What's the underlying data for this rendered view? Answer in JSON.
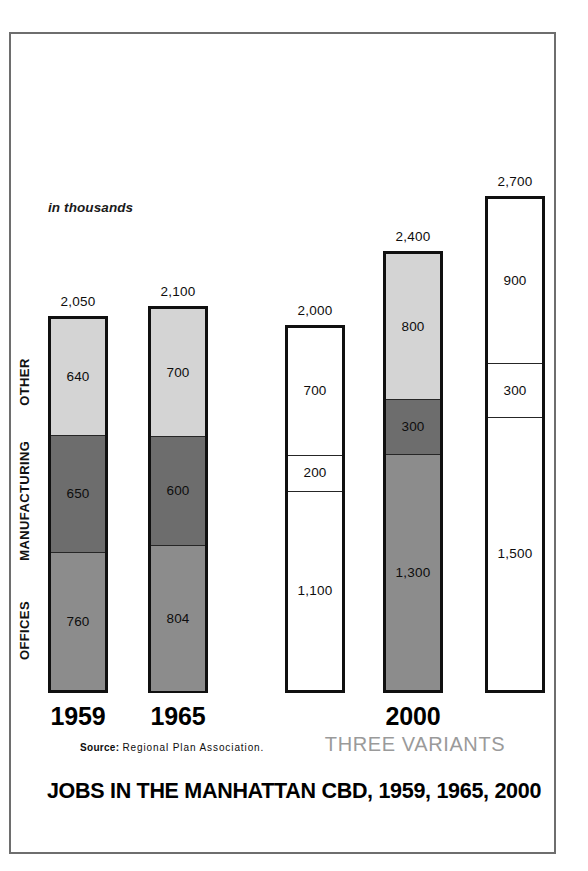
{
  "chart_data": {
    "type": "bar",
    "title": "JOBS IN THE MANHATTAN CBD, 1959, 1965, 2000",
    "subtitle": "in thousands",
    "units_note": "in thousands",
    "source": {
      "lead": "Source:",
      "body": "Regional Plan Association."
    },
    "xlabel": "",
    "ylabel": "",
    "ylim": [
      0,
      2700
    ],
    "grid": false,
    "legend_position": "left-axis-rotated",
    "stacked": true,
    "series": [
      {
        "name": "OFFICES",
        "values": [
          760,
          804,
          1100,
          1300,
          1500
        ]
      },
      {
        "name": "MANUFACTURING",
        "values": [
          650,
          600,
          200,
          300,
          300
        ]
      },
      {
        "name": "OTHER",
        "values": [
          640,
          700,
          700,
          800,
          900
        ]
      }
    ],
    "categories": [
      "1959",
      "1965",
      "2000 variant A",
      "2000 variant B",
      "2000 variant C"
    ],
    "totals": [
      2050,
      2100,
      2000,
      2400,
      2700
    ],
    "annotations": [
      "THREE VARIANTS applies to the last three bars (2000)"
    ]
  },
  "axis_labels": [
    {
      "name": "OTHER",
      "text": "OTHER"
    },
    {
      "name": "MANUFACTURING",
      "text": "MANUFACTURING"
    },
    {
      "name": "OFFICES",
      "text": "OFFICES"
    }
  ],
  "bars": [
    {
      "id": "bar-1959",
      "total_label": "2,050",
      "year_label": "1959",
      "filled": true,
      "segments": [
        {
          "part": "OTHER",
          "label": "640",
          "fill": "light"
        },
        {
          "part": "MANUFACTURING",
          "label": "650",
          "fill": "dark"
        },
        {
          "part": "OFFICES",
          "label": "760",
          "fill": "medium"
        }
      ]
    },
    {
      "id": "bar-1965",
      "total_label": "2,100",
      "year_label": "1965",
      "filled": true,
      "segments": [
        {
          "part": "OTHER",
          "label": "700",
          "fill": "light"
        },
        {
          "part": "MANUFACTURING",
          "label": "600",
          "fill": "dark"
        },
        {
          "part": "OFFICES",
          "label": "804",
          "fill": "medium"
        }
      ]
    },
    {
      "id": "bar-2000-a",
      "total_label": "2,000",
      "year_label": "",
      "filled": false,
      "segments": [
        {
          "part": "OTHER",
          "label": "700",
          "fill": "white"
        },
        {
          "part": "MANUFACTURING",
          "label": "200",
          "fill": "white"
        },
        {
          "part": "OFFICES",
          "label": "1,100",
          "fill": "white"
        }
      ]
    },
    {
      "id": "bar-2000-b",
      "total_label": "2,400",
      "year_label": "2000",
      "filled": true,
      "segments": [
        {
          "part": "OTHER",
          "label": "800",
          "fill": "light"
        },
        {
          "part": "MANUFACTURING",
          "label": "300",
          "fill": "dark"
        },
        {
          "part": "OFFICES",
          "label": "1,300",
          "fill": "medium"
        }
      ]
    },
    {
      "id": "bar-2000-c",
      "total_label": "2,700",
      "year_label": "",
      "filled": false,
      "segments": [
        {
          "part": "OTHER",
          "label": "900",
          "fill": "white"
        },
        {
          "part": "MANUFACTURING",
          "label": "300",
          "fill": "white"
        },
        {
          "part": "OFFICES",
          "label": "1,500",
          "fill": "white"
        }
      ]
    }
  ],
  "year_labels": [
    {
      "text": "1959"
    },
    {
      "text": "1965"
    },
    {
      "text": "2000"
    }
  ],
  "variants_label": "THREE VARIANTS",
  "colors": {
    "light": "#d4d4d4",
    "medium": "#8c8c8c",
    "dark": "#6d6d6d",
    "white": "#ffffff",
    "outline": "#101010",
    "frame": "#6e6e6e",
    "variants_text": "#9a9a9a"
  }
}
